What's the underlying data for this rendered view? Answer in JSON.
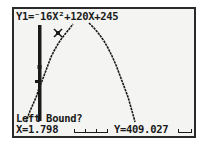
{
  "screen": {
    "equation": "Y1=⁻16X²+120X+245",
    "prompt": "Left Bound?",
    "cursor": {
      "x_label": "X=1.798",
      "y_label": "Y=409.027",
      "x_value": 1.798,
      "y_value": 409.027
    },
    "colors": {
      "background": "#f4f4f2",
      "ink": "#1a1a1a",
      "border": "#2a2a2a"
    }
  },
  "graph": {
    "function": "-16X^2+120X+245",
    "bound_marker": "left-bound-vertical-line",
    "cursor_marker": "x-cross-marker"
  }
}
